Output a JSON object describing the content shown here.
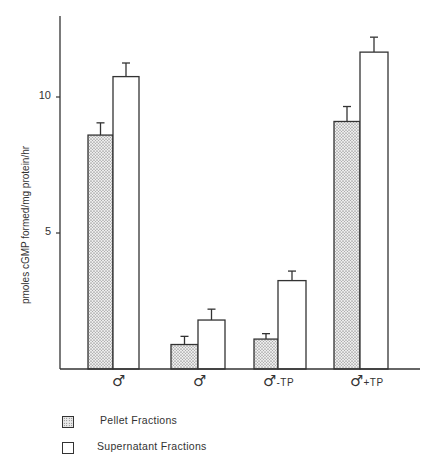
{
  "chart_data": {
    "type": "bar",
    "title": "",
    "xlabel": "",
    "ylabel": "pmoles cGMP formed/mg protein/hr",
    "ylim": [
      0,
      13
    ],
    "yticks": [
      5,
      10
    ],
    "grid": false,
    "legend_position": "bottom-left",
    "categories": [
      "♂",
      "♂ (castrate)",
      "♂ (castrate) -TP",
      "♂ (castrate) +TP"
    ],
    "category_labels": [
      {
        "symbol": "♂",
        "suffix": ""
      },
      {
        "symbol": "♂",
        "suffix": ""
      },
      {
        "symbol": "♂",
        "suffix": "-TP"
      },
      {
        "symbol": "♂",
        "suffix": "+TP"
      }
    ],
    "series": [
      {
        "name": "Pellet Fractions",
        "pattern": "stippled",
        "values": [
          8.6,
          0.9,
          1.1,
          9.1
        ],
        "errors": [
          0.45,
          0.3,
          0.2,
          0.55
        ]
      },
      {
        "name": "Supernatant Fractions",
        "pattern": "open",
        "values": [
          10.75,
          1.8,
          3.25,
          11.65
        ],
        "errors": [
          0.5,
          0.4,
          0.35,
          0.55
        ]
      }
    ]
  },
  "axis": {
    "ylabel": "pmoles cGMP formed/mg protein/hr",
    "tick_10": "10",
    "tick_5": "5"
  },
  "legend": {
    "pellet": "Pellet Fractions",
    "supernatant": "Supernatant Fractions"
  },
  "xlabels": [
    {
      "symbol": "♂",
      "suffix": ""
    },
    {
      "symbol": "♂",
      "suffix": ""
    },
    {
      "symbol": "♂",
      "suffix": "-TP"
    },
    {
      "symbol": "♂",
      "suffix": "+TP"
    }
  ]
}
